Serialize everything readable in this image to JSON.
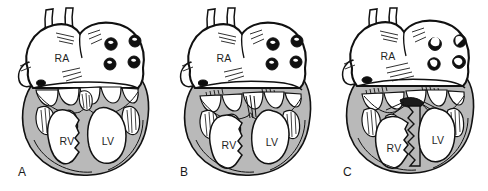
{
  "figure": {
    "background_color": "#ffffff",
    "panel_count": 3
  },
  "style": {
    "outline_color": "#111111",
    "myocardium_fill": "#b9b9b9",
    "myocardium_fill_light": "#c6c6c6",
    "chamber_fill": "#ffffff",
    "vein_opening_fill": "#101010",
    "vein_highlight_fill": "#ffffff",
    "coronary_sinus_fill": "#0d0d0d",
    "hatch_color": "#1a1a1a",
    "label_color": "#1a1a1a"
  },
  "panels": [
    {
      "id": "panel-a",
      "label": "A",
      "label_x": 18,
      "label_y": 166,
      "offset_x": 0,
      "chambers": [
        {
          "name": "RA",
          "label": "RA",
          "x": 62,
          "y": 62
        },
        {
          "name": "RV",
          "label": "RV",
          "x": 67,
          "y": 145
        },
        {
          "name": "LV",
          "label": "LV",
          "x": 108,
          "y": 145
        }
      ],
      "vein_openings": [
        {
          "cx": 111,
          "cy": 44,
          "r": 6.2,
          "highlight": "small"
        },
        {
          "cx": 135,
          "cy": 41,
          "r": 6.0,
          "highlight": "small"
        },
        {
          "cx": 110,
          "cy": 64,
          "r": 6.0,
          "highlight": "small"
        },
        {
          "cx": 134,
          "cy": 62,
          "r": 6.0,
          "highlight": "small"
        }
      ],
      "coronary_sinus": {
        "cx": 41,
        "cy": 83,
        "rx": 4.4,
        "ry": 3.0
      },
      "septum_style": "thin-offset",
      "rv_size": "large",
      "valve_note": "AV valve leaflets offset; septal attachment narrow"
    },
    {
      "id": "panel-b",
      "label": "B",
      "label_x": 180,
      "label_y": 166,
      "offset_x": 162,
      "chambers": [
        {
          "name": "RA",
          "label": "RA",
          "x": 62,
          "y": 62
        },
        {
          "name": "RV",
          "label": "RV",
          "x": 67,
          "y": 145
        },
        {
          "name": "LV",
          "label": "LV",
          "x": 110,
          "y": 143
        }
      ],
      "vein_openings": [
        {
          "cx": 111,
          "cy": 44,
          "r": 6.2,
          "highlight": "small"
        },
        {
          "cx": 135,
          "cy": 41,
          "r": 6.0,
          "highlight": "small"
        },
        {
          "cx": 110,
          "cy": 64,
          "r": 6.0,
          "highlight": "small"
        },
        {
          "cx": 134,
          "cy": 62,
          "r": 6.0,
          "highlight": "small"
        }
      ],
      "coronary_sinus": {
        "cx": 41,
        "cy": 83,
        "rx": 4.6,
        "ry": 3.0
      },
      "septum_style": "common-junction",
      "rv_size": "large",
      "valve_note": "Common AV junction; leaflets converge at midline"
    },
    {
      "id": "panel-c",
      "label": "C",
      "label_x": 343,
      "label_y": 166,
      "offset_x": 324,
      "chambers": [
        {
          "name": "RA",
          "label": "RA",
          "x": 64,
          "y": 62
        },
        {
          "name": "RV",
          "label": "RV",
          "x": 72,
          "y": 148
        },
        {
          "name": "LV",
          "label": "LV",
          "x": 112,
          "y": 141
        }
      ],
      "vein_openings": [
        {
          "cx": 111,
          "cy": 44,
          "r": 6.4,
          "highlight": "large"
        },
        {
          "cx": 136,
          "cy": 41,
          "r": 6.2,
          "highlight": "large"
        },
        {
          "cx": 110,
          "cy": 64,
          "r": 6.2,
          "highlight": "large"
        },
        {
          "cx": 135,
          "cy": 62,
          "r": 6.4,
          "highlight": "large"
        }
      ],
      "coronary_sinus": {
        "cx": 43,
        "cy": 80,
        "rx": 5.0,
        "ry": 3.2
      },
      "septum_style": "thick-jagged",
      "rv_size": "small",
      "valve_note": "Thickened trabeculated septum; RV cavity reduced"
    }
  ],
  "great_vessels": {
    "left_stem_label": "superior vena cava",
    "right_stem_label": "aorta"
  }
}
